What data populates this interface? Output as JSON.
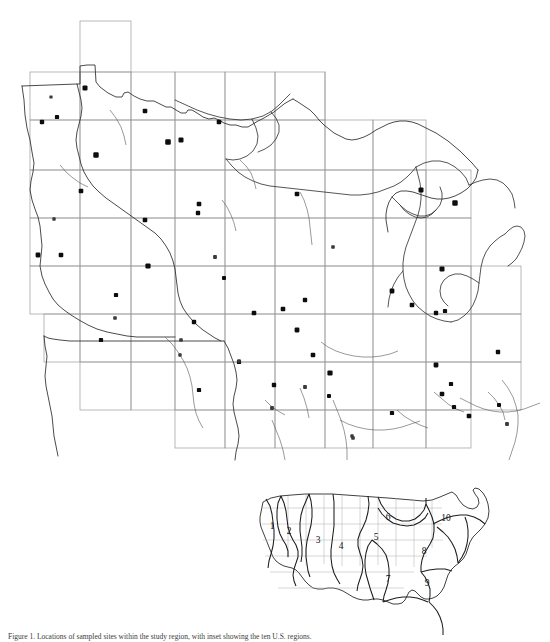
{
  "figure": {
    "caption_partial": "Figure 1. Locations of sampled sites within the study region, with inset showing the ten U.S. regions.",
    "colors": {
      "grid": "#9a9a9a",
      "boundary": "#2b2b2b",
      "site_marker": "#0d0d0d",
      "inset_region": "#1d1d1d",
      "background": "#ffffff"
    }
  },
  "main_map": {
    "name": "upper-midwest-sampling-map",
    "description": "Outline map of Minnesota, Wisconsin, Michigan, Iowa, Illinois and Indiana with a rectangular sampling grid overlay and filled point symbols marking sample locations.",
    "states_shown": [
      "Minnesota",
      "Wisconsin",
      "Michigan",
      "Iowa",
      "Illinois",
      "Indiana"
    ],
    "grid": {
      "name": "sampling-grid",
      "cell_width": 64,
      "cell_height": 48,
      "note": "Irregular staircase block of rectangular grid cells covering the study region"
    },
    "site_count": 58
  },
  "chart_data": {
    "type": "scatter",
    "xlabel": "",
    "ylabel": "",
    "xlim": [
      0,
      550
    ],
    "ylim": [
      0,
      460
    ],
    "grid": true,
    "legend": "none",
    "series": [
      {
        "name": "Sampling sites",
        "marker": "filled-square",
        "color": "#0d0d0d",
        "points": [
          {
            "x": 85,
            "y": 88,
            "size": 5
          },
          {
            "x": 51,
            "y": 97,
            "size": 3.2
          },
          {
            "x": 57,
            "y": 117,
            "size": 4.2
          },
          {
            "x": 42,
            "y": 122,
            "size": 4.4
          },
          {
            "x": 145,
            "y": 111,
            "size": 4.6
          },
          {
            "x": 219,
            "y": 122,
            "size": 4.6
          },
          {
            "x": 168,
            "y": 142,
            "size": 5.6
          },
          {
            "x": 181,
            "y": 140,
            "size": 5.0
          },
          {
            "x": 96,
            "y": 155,
            "size": 5.4
          },
          {
            "x": 81,
            "y": 191,
            "size": 4.6
          },
          {
            "x": 54,
            "y": 219,
            "size": 3.4
          },
          {
            "x": 145,
            "y": 220,
            "size": 4.6
          },
          {
            "x": 38,
            "y": 255,
            "size": 4.8
          },
          {
            "x": 61,
            "y": 255,
            "size": 4.6
          },
          {
            "x": 199,
            "y": 204,
            "size": 4.6
          },
          {
            "x": 148,
            "y": 266,
            "size": 5.2
          },
          {
            "x": 215,
            "y": 257,
            "size": 3.8
          },
          {
            "x": 224,
            "y": 278,
            "size": 4.0
          },
          {
            "x": 116,
            "y": 295,
            "size": 4.2
          },
          {
            "x": 115,
            "y": 318,
            "size": 3.6
          },
          {
            "x": 101,
            "y": 340,
            "size": 4.2
          },
          {
            "x": 181,
            "y": 340,
            "size": 3.6
          },
          {
            "x": 194,
            "y": 322,
            "size": 4.4
          },
          {
            "x": 239,
            "y": 362,
            "size": 4.2
          },
          {
            "x": 199,
            "y": 390,
            "size": 4.2
          },
          {
            "x": 254,
            "y": 313,
            "size": 4.6
          },
          {
            "x": 283,
            "y": 309,
            "size": 4.6
          },
          {
            "x": 305,
            "y": 300,
            "size": 4.4
          },
          {
            "x": 297,
            "y": 330,
            "size": 4.8
          },
          {
            "x": 313,
            "y": 355,
            "size": 4.6
          },
          {
            "x": 274,
            "y": 385,
            "size": 4.4
          },
          {
            "x": 305,
            "y": 387,
            "size": 3.8
          },
          {
            "x": 330,
            "y": 373,
            "size": 5.2
          },
          {
            "x": 297,
            "y": 194,
            "size": 4.6
          },
          {
            "x": 198,
            "y": 213,
            "size": 4.4
          },
          {
            "x": 333,
            "y": 247,
            "size": 3.6
          },
          {
            "x": 421,
            "y": 190,
            "size": 5.0
          },
          {
            "x": 455,
            "y": 203,
            "size": 5.4
          },
          {
            "x": 442,
            "y": 269,
            "size": 5.0
          },
          {
            "x": 392,
            "y": 291,
            "size": 4.8
          },
          {
            "x": 412,
            "y": 305,
            "size": 4.6
          },
          {
            "x": 436,
            "y": 313,
            "size": 4.4
          },
          {
            "x": 445,
            "y": 311,
            "size": 4.2
          },
          {
            "x": 436,
            "y": 365,
            "size": 4.8
          },
          {
            "x": 451,
            "y": 384,
            "size": 4.2
          },
          {
            "x": 442,
            "y": 394,
            "size": 4.6
          },
          {
            "x": 454,
            "y": 407,
            "size": 4.2
          },
          {
            "x": 498,
            "y": 352,
            "size": 4.4
          },
          {
            "x": 499,
            "y": 405,
            "size": 4.0
          },
          {
            "x": 507,
            "y": 424,
            "size": 3.8
          },
          {
            "x": 392,
            "y": 413,
            "size": 4.2
          },
          {
            "x": 353,
            "y": 438,
            "size": 3.6
          },
          {
            "x": 352,
            "y": 436,
            "size": 3.4
          },
          {
            "x": 272,
            "y": 408,
            "size": 3.8
          },
          {
            "x": 180,
            "y": 355,
            "size": 3.4
          },
          {
            "x": 239,
            "y": 361,
            "size": 3.6
          },
          {
            "x": 329,
            "y": 396,
            "size": 4.0
          },
          {
            "x": 469,
            "y": 416,
            "size": 4.6
          }
        ]
      }
    ]
  },
  "inset_map": {
    "name": "us-regions-inset",
    "description": "Small locator map of the conterminous United States divided into ten numbered regions.",
    "region_labels": [
      {
        "id": "1",
        "x": 272,
        "y": 529
      },
      {
        "id": "2",
        "x": 289,
        "y": 534
      },
      {
        "id": "3",
        "x": 318,
        "y": 543
      },
      {
        "id": "4",
        "x": 341,
        "y": 549
      },
      {
        "id": "5",
        "x": 376,
        "y": 540
      },
      {
        "id": "6",
        "x": 388,
        "y": 520
      },
      {
        "id": "7",
        "x": 388,
        "y": 582
      },
      {
        "id": "8",
        "x": 424,
        "y": 554
      },
      {
        "id": "9",
        "x": 427,
        "y": 586
      },
      {
        "id": "10",
        "x": 446,
        "y": 521
      }
    ],
    "region_count": 10
  }
}
